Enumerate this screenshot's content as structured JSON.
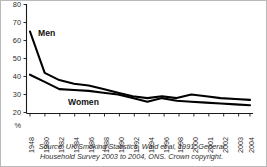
{
  "chart_data": {
    "type": "line",
    "title": "",
    "subtitle": "",
    "xlabel": "",
    "ylabel": "%",
    "ylim": [
      20,
      80
    ],
    "yticks": [
      80,
      70,
      60,
      50,
      40,
      30,
      20
    ],
    "grid": false,
    "legend_position": "inline-annotation",
    "categories": [
      "1948",
      "1980",
      "1982",
      "1984",
      "1986",
      "1988",
      "1990",
      "1992",
      "1994",
      "1996",
      "1998",
      "2000",
      "2001",
      "2002",
      "2003",
      "2004"
    ],
    "series": [
      {
        "name": "Men",
        "values": [
          65,
          42,
          38,
          36,
          35,
          33,
          31,
          29,
          28,
          29,
          28,
          30,
          29,
          28,
          27.5,
          27
        ]
      },
      {
        "name": "Women",
        "values": [
          41,
          37,
          33,
          32.5,
          32,
          31,
          30,
          28,
          26,
          28,
          26.5,
          26,
          25.5,
          25,
          24.5,
          24
        ]
      }
    ],
    "annotations": [
      {
        "text": "Men",
        "x": "1980",
        "y": 58
      },
      {
        "text": "Women",
        "x": "1988",
        "y": 24.5
      }
    ]
  },
  "axis": {
    "y_unit": "%",
    "y_tick_labels": [
      "80",
      "70",
      "60",
      "50",
      "40",
      "30",
      "20"
    ],
    "x_tick_labels": [
      "1948",
      "1980",
      "1982",
      "1984",
      "1986",
      "1988",
      "1990",
      "1992",
      "1994",
      "1996",
      "1998",
      "2000",
      "2001",
      "2002",
      "2003",
      "2004"
    ]
  },
  "series_labels": {
    "men": "Men",
    "women": "Women"
  },
  "source": {
    "line1": "Source: UK Smoking Statistics, Wald et al, 1991; General",
    "line2": "Household Survey 2003 to 2004, ONS. Crown copyright."
  },
  "colors": {
    "line": "#000000",
    "axis": "#1a1a1a",
    "text": "#2b2b2b",
    "frame": "#b9b9b9",
    "background": "#ffffff"
  }
}
